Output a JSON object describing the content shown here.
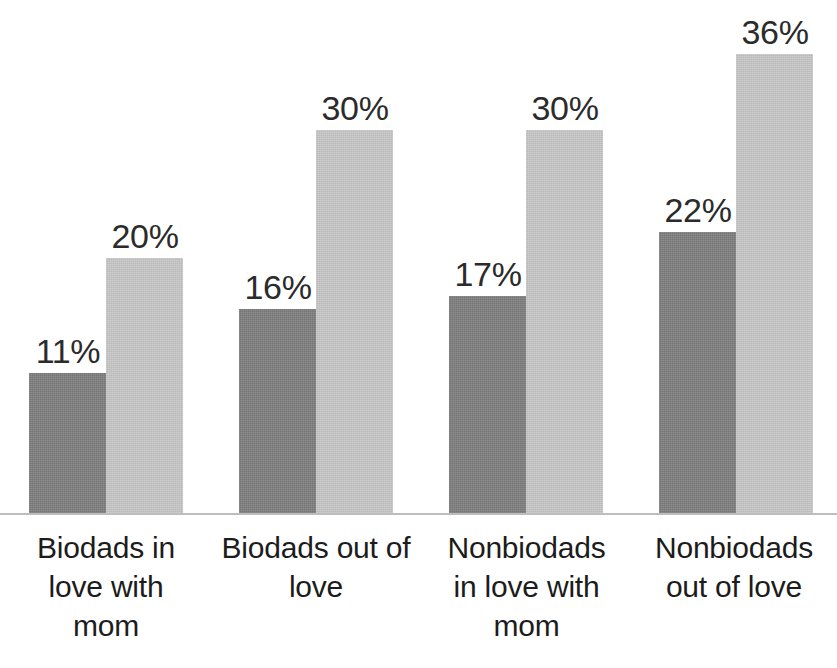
{
  "chart_data": {
    "type": "bar",
    "title": "",
    "subtitle": "",
    "xlabel": "",
    "ylabel": "",
    "ylim": [
      0,
      40
    ],
    "grid": false,
    "legend": "none",
    "orientation": "vertical",
    "value_suffix": "%",
    "categories": [
      "Biodads in love with mom",
      "Biodads out of love",
      "Nonbiodads in love with mom",
      "Nonbiodads out of love"
    ],
    "category_lines": [
      [
        "Biodads in",
        "love with",
        "mom"
      ],
      [
        "Biodads out of",
        "love"
      ],
      [
        "Nonbiodads",
        "in love with",
        "mom"
      ],
      [
        "Nonbiodads",
        "out of love"
      ]
    ],
    "series": [
      {
        "name": "series-1",
        "color": "#7f7f7f",
        "values": [
          11,
          16,
          17,
          22
        ],
        "labels": [
          "11%",
          "16%",
          "17%",
          "22%"
        ]
      },
      {
        "name": "series-2",
        "color": "#c9c9c9",
        "values": [
          20,
          30,
          30,
          36
        ],
        "labels": [
          "20%",
          "30%",
          "30%",
          "36%"
        ]
      }
    ],
    "axis_line_color": "#bdbdbd",
    "background_color": "#ffffff",
    "label_text_color": "#2b2b2b"
  },
  "layout": {
    "group_left_px": [
      29,
      239,
      449,
      659
    ],
    "group_width_px": 154,
    "bar_width_px": 77,
    "baseline_y_px": 513,
    "px_per_percent": 12.75
  }
}
